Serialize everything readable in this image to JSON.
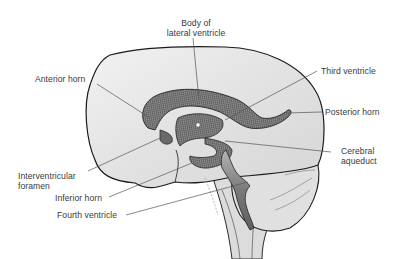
{
  "diagram": {
    "labels": {
      "body_of_lateral_ventricle_line1": "Body of",
      "body_of_lateral_ventricle_line2": "lateral ventricle",
      "anterior_horn": "Anterior horn",
      "third_ventricle": "Third ventricle",
      "posterior_horn": "Posterior horn",
      "cerebral_aqueduct_line1": "Cerebral",
      "cerebral_aqueduct_line2": "aqueduct",
      "interventricular_foramen_line1": "Interventricular",
      "interventricular_foramen_line2": "foramen",
      "inferior_horn": "Inferior horn",
      "fourth_ventricle": "Fourth ventricle"
    },
    "colors": {
      "background": "#ffffff",
      "outline": "#1e1e1e",
      "brain_fill": "#e6e6e6",
      "ventricle_fill": "#8a8a8a",
      "leader_line": "#555555",
      "label_text": "#3a3a3a"
    }
  }
}
